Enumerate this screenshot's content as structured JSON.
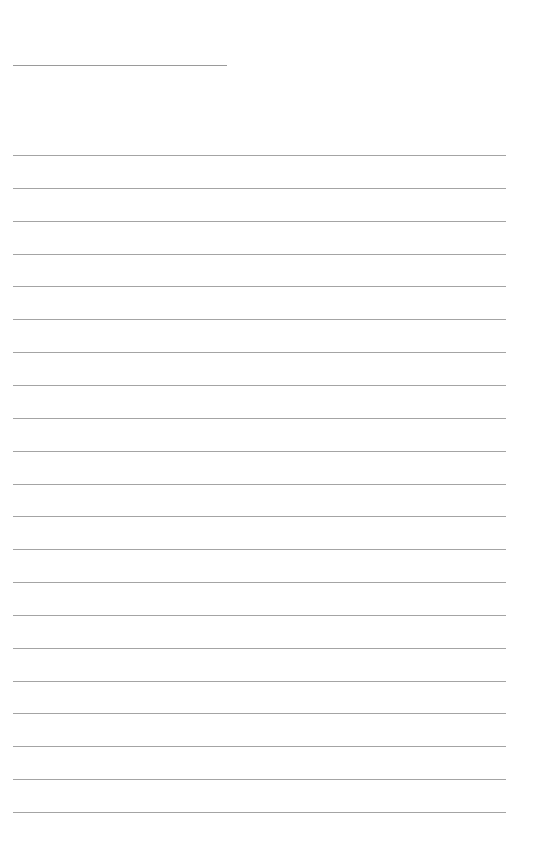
{
  "page": {
    "type": "lined-paper",
    "background_color": "#ffffff",
    "line_color": "#a4a4a4",
    "header_line": {
      "present": true,
      "text": ""
    },
    "ruled_lines": {
      "count": 21,
      "first_y": 155,
      "spacing": 32.85,
      "lines_text": [
        "",
        "",
        "",
        "",
        "",
        "",
        "",
        "",
        "",
        "",
        "",
        "",
        "",
        "",
        "",
        "",
        "",
        "",
        "",
        "",
        ""
      ]
    }
  }
}
